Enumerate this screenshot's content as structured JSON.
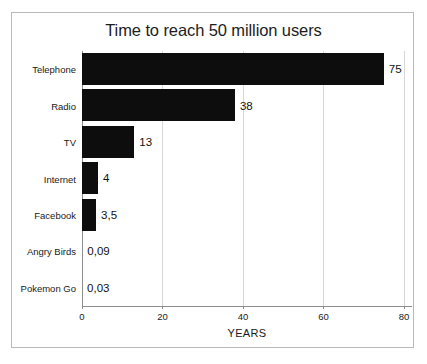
{
  "chart_data": {
    "type": "bar",
    "orientation": "horizontal",
    "title": "Time to reach 50 million users",
    "xlabel": "YEARS",
    "ylabel": "",
    "xlim": [
      0,
      82
    ],
    "xticks": [
      "0",
      "20",
      "40",
      "60",
      "80"
    ],
    "xtick_values": [
      0,
      20,
      40,
      60,
      80
    ],
    "grid": "vertical-only",
    "legend": "none",
    "bar_color": "#0d0d0d",
    "categories": [
      "Telephone",
      "Radio",
      "TV",
      "Internet",
      "Facebook",
      "Angry Birds",
      "Pokemon Go"
    ],
    "values": [
      75,
      38,
      13,
      4,
      3.5,
      0.09,
      0.03
    ],
    "value_labels": [
      "75",
      "38",
      "13",
      "4",
      "3,5",
      "0,09",
      "0,03"
    ]
  },
  "frame": {
    "border_color": "#b9b9b9",
    "background": "#ffffff"
  }
}
